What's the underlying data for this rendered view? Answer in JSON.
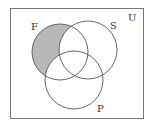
{
  "diagram": {
    "type": "venn",
    "universe_label": "U",
    "sets": [
      {
        "label": "F",
        "cx": 60,
        "cy": 52,
        "r": 28
      },
      {
        "label": "S",
        "cx": 88,
        "cy": 50,
        "r": 29
      },
      {
        "label": "P",
        "cx": 74,
        "cy": 80,
        "r": 29
      }
    ],
    "shaded_region": "F only (F ∩ S' ∩ P')",
    "colors": {
      "shade": "#b8b8b8",
      "stroke": "#555555",
      "background": "#ffffff"
    }
  }
}
